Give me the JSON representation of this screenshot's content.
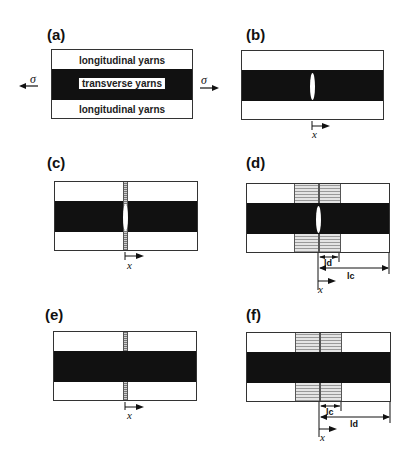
{
  "panels": {
    "a": {
      "label": "(a)",
      "top_band": "longitudinal yarns",
      "middle_band": "transverse yarns",
      "bottom_band": "longitudinal yarns",
      "stress_left": "σ",
      "stress_right": "σ"
    },
    "b": {
      "label": "(b)",
      "axis": "x"
    },
    "c": {
      "label": "(c)",
      "axis": "x"
    },
    "d": {
      "label": "(d)",
      "axis": "x",
      "dim_inner": "ld",
      "dim_outer": "lc"
    },
    "e": {
      "label": "(e)",
      "axis": "x"
    },
    "f": {
      "label": "(f)",
      "axis": "x",
      "dim_inner": "lc",
      "dim_outer": "ld"
    }
  },
  "colors": {
    "band": "#111111",
    "hatch": "#999999",
    "border": "#333333"
  }
}
